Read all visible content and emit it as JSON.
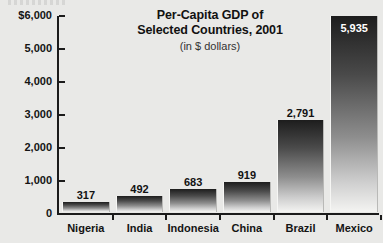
{
  "chart_data": {
    "type": "bar",
    "title": "Per-Capita GDP of Selected Countries, 2001",
    "title_lines": [
      "Per-Capita GDP of",
      "Selected Countries, 2001"
    ],
    "subtitle": "(in $ dollars)",
    "xlabel": "",
    "ylabel": "",
    "ylim": [
      0,
      6000
    ],
    "grid": false,
    "legend": null,
    "categories": [
      "Nigeria",
      "India",
      "Indonesia",
      "China",
      "Brazil",
      "Mexico"
    ],
    "values": [
      317,
      492,
      683,
      919,
      2791,
      5935
    ],
    "value_labels": [
      "317",
      "492",
      "683",
      "919",
      "2,791",
      "5,935"
    ],
    "ytick_values": [
      0,
      1000,
      2000,
      3000,
      4000,
      5000,
      6000
    ],
    "ytick_labels": [
      "0",
      "1,000",
      "2,000",
      "3,000",
      "4,000",
      "5,000",
      "$6,000"
    ],
    "bar_label_position": [
      "above",
      "above",
      "above",
      "above",
      "above",
      "inside"
    ],
    "colors": {
      "background": "#e9e9e7",
      "bar_gradient_top": "#1d1d1d",
      "bar_gradient_bottom": "#f4f4f2",
      "axis": "#1b1b1b",
      "text": "#141414",
      "inside_label_text": "#ffffff"
    }
  }
}
